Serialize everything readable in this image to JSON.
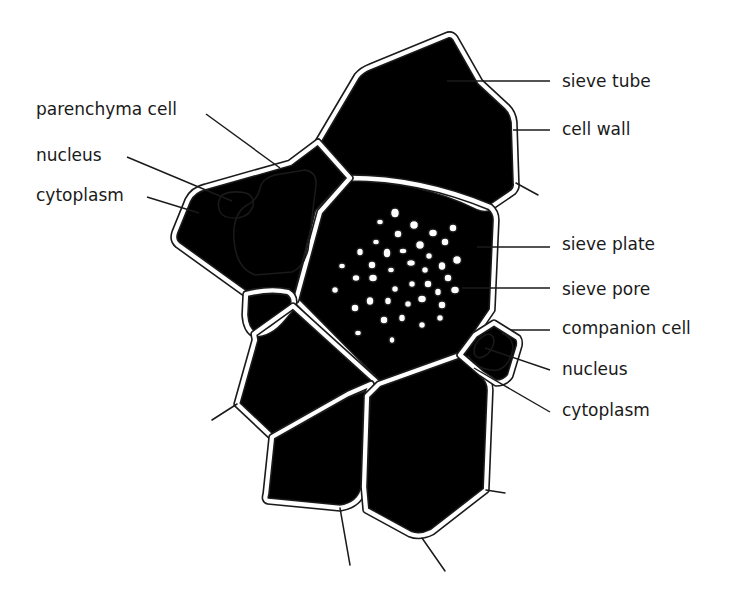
{
  "diagram": {
    "labels_left": [
      {
        "id": "parenchyma-cell",
        "text": "parenchyma cell",
        "x": 36,
        "y": 101
      },
      {
        "id": "nucleus-left",
        "text": "nucleus",
        "x": 36,
        "y": 147
      },
      {
        "id": "cytoplasm-left",
        "text": "cytoplasm",
        "x": 36,
        "y": 187
      }
    ],
    "labels_right": [
      {
        "id": "sieve-tube",
        "text": "sieve tube",
        "x": 562,
        "y": 73
      },
      {
        "id": "cell-wall",
        "text": "cell wall",
        "x": 562,
        "y": 121
      },
      {
        "id": "sieve-plate",
        "text": "sieve plate",
        "x": 562,
        "y": 236
      },
      {
        "id": "sieve-pore",
        "text": "sieve pore",
        "x": 562,
        "y": 281
      },
      {
        "id": "companion-cell",
        "text": "companion cell",
        "x": 562,
        "y": 320
      },
      {
        "id": "nucleus-right",
        "text": "nucleus",
        "x": 562,
        "y": 361
      },
      {
        "id": "cytoplasm-right",
        "text": "cytoplasm",
        "x": 562,
        "y": 402
      }
    ],
    "colors": {
      "line": "#1a1a1a",
      "background": "#ffffff"
    }
  }
}
